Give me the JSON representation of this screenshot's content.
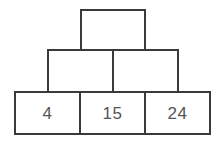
{
  "figure": {
    "name": "number-pyramid",
    "colors": {
      "background": "#ffffff",
      "border": "#3a3a3a",
      "text": "#555555"
    }
  },
  "rows": {
    "top": {
      "label": "top-row",
      "cells": [
        {
          "value": "",
          "filled": false
        }
      ]
    },
    "middle": {
      "label": "middle-row",
      "cells": [
        {
          "value": "",
          "filled": false
        },
        {
          "value": "",
          "filled": false
        }
      ]
    },
    "bottom": {
      "label": "bottom-row",
      "cells": [
        {
          "value": "4",
          "filled": true
        },
        {
          "value": "15",
          "filled": true
        },
        {
          "value": "24",
          "filled": true
        }
      ]
    }
  },
  "chart_data": {
    "type": "table",
    "title": "",
    "structure": "pyramid",
    "tiers": 3,
    "tier_cell_counts": [
      1,
      2,
      3
    ],
    "values_by_tier": [
      [
        ""
      ],
      [
        "",
        ""
      ],
      [
        "4",
        "15",
        "24"
      ]
    ],
    "known_values": [
      4,
      15,
      24
    ],
    "known_value_positions": [
      "bottom-1",
      "bottom-2",
      "bottom-3"
    ],
    "empty_cells": [
      "top-1",
      "middle-1",
      "middle-2"
    ]
  }
}
